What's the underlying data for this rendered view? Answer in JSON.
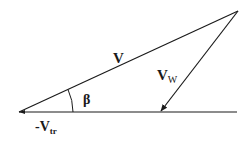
{
  "diagram": {
    "type": "vector-triangle",
    "colors": {
      "line": "#1a1a1a",
      "background": "#ffffff"
    },
    "labels": {
      "V": {
        "main": "V"
      },
      "V_W": {
        "main": "V",
        "sub": "W"
      },
      "beta": {
        "main": "β"
      },
      "neg_V_tr": {
        "main": "-V",
        "sub": "tr"
      }
    }
  }
}
